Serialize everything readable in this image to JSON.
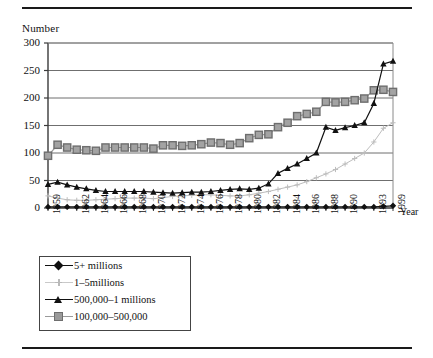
{
  "figure": {
    "top_rule": "horizontal-rule",
    "bottom_rule": "horizontal-rule"
  },
  "chart_data": {
    "type": "line",
    "title": "",
    "xlabel": "Year",
    "ylabel": "Number",
    "ylim": [
      0,
      300
    ],
    "yticks": [
      0,
      50,
      100,
      150,
      200,
      250,
      300
    ],
    "grid": true,
    "legend_position": "below-axes-left",
    "categories": [
      "1959",
      "1960",
      "1961",
      "1962",
      "1963",
      "1964",
      "1965",
      "1966",
      "1967",
      "1968",
      "1969",
      "1970",
      "1971",
      "1972",
      "1973",
      "1974",
      "1975",
      "1976",
      "1977",
      "1978",
      "1979",
      "1980",
      "1981",
      "1982",
      "1983",
      "1984",
      "1985",
      "1986",
      "1987",
      "1988",
      "1989",
      "1990",
      "1991",
      "1992",
      "1993",
      "1994",
      "1999"
    ],
    "xtick_labels": [
      "1959",
      "1962",
      "1964",
      "1966",
      "1968",
      "1970",
      "1972",
      "1974",
      "1976",
      "1978",
      "1980",
      "1982",
      "1984",
      "1986",
      "1988",
      "1990",
      "1993",
      "1999"
    ],
    "series": [
      {
        "name": "5+ millions",
        "color": "#111111",
        "marker": "diamond",
        "values": [
          2,
          2,
          2,
          2,
          2,
          2,
          2,
          2,
          2,
          2,
          2,
          2,
          2,
          2,
          2,
          2,
          2,
          2,
          2,
          2,
          2,
          2,
          2,
          2,
          2,
          2,
          2,
          2,
          2,
          2,
          2,
          2,
          2,
          2,
          2,
          3,
          4
        ]
      },
      {
        "name": "1–5millions",
        "color": "#bdbdbd",
        "marker": "cross",
        "values": [
          22,
          18,
          15,
          14,
          14,
          15,
          16,
          17,
          18,
          18,
          18,
          17,
          19,
          21,
          22,
          23,
          24,
          24,
          23,
          22,
          22,
          24,
          27,
          30,
          34,
          38,
          42,
          48,
          55,
          62,
          70,
          80,
          90,
          100,
          120,
          145,
          155
        ]
      },
      {
        "name": "500,000–1 millions",
        "color": "#111111",
        "marker": "triangle",
        "values": [
          43,
          47,
          42,
          38,
          35,
          32,
          30,
          30,
          30,
          30,
          30,
          29,
          28,
          27,
          28,
          29,
          29,
          30,
          32,
          34,
          35,
          34,
          36,
          44,
          63,
          72,
          80,
          90,
          100,
          147,
          141,
          146,
          150,
          155,
          190,
          262,
          267
        ]
      },
      {
        "name": "100,000–500,000",
        "color": "#9a9a9a",
        "marker": "square",
        "values": [
          95,
          115,
          110,
          106,
          105,
          104,
          110,
          110,
          110,
          110,
          110,
          108,
          114,
          114,
          113,
          114,
          116,
          119,
          118,
          115,
          118,
          127,
          133,
          134,
          147,
          155,
          167,
          171,
          175,
          193,
          192,
          193,
          196,
          199,
          214,
          215,
          211
        ]
      }
    ]
  },
  "legend": {
    "items": [
      {
        "label": "5+ millions",
        "marker": "diamond-marker"
      },
      {
        "label": "1–5millions",
        "marker": "cross-marker"
      },
      {
        "label": "500,000–1 millions",
        "marker": "triangle-marker"
      },
      {
        "label": "100,000–500,000",
        "marker": "square-marker"
      }
    ]
  }
}
